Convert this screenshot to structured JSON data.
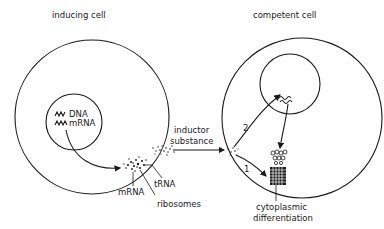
{
  "figure": {
    "type": "biological schematic",
    "background": "#ffffff",
    "ink_color": "#1a1a1a"
  },
  "inducing_cell": {
    "title": "inducing cell",
    "nucleus_labels": [
      "DNA",
      "mRNA"
    ],
    "cytoplasm_labels": [
      "mRNA",
      "tRNA",
      "ribosomes"
    ]
  },
  "transfer": {
    "label_line1": "inductor",
    "label_line2": "substance"
  },
  "competent_cell": {
    "title": "competent cell",
    "pathway_labels": [
      "1",
      "2"
    ],
    "outcome_line1": "cytoplasmic",
    "outcome_line2": "differentiation"
  }
}
